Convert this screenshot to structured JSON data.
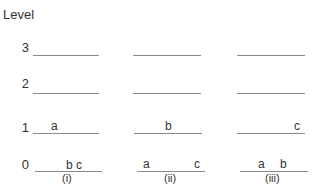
{
  "title": "Level",
  "levels": [
    "3",
    "2",
    "1",
    "0"
  ],
  "columns": [
    {
      "caption": "(i)",
      "level1": [
        "a"
      ],
      "level0": [
        "b",
        "c"
      ]
    },
    {
      "caption": "(ii)",
      "level1": [
        "b"
      ],
      "level0": [
        "a",
        "c"
      ]
    },
    {
      "caption": "(iii)",
      "level1": [
        "c"
      ],
      "level0": [
        "a",
        "b"
      ]
    }
  ],
  "colors": {
    "line": "#8a8a8a",
    "text": "#333333"
  }
}
